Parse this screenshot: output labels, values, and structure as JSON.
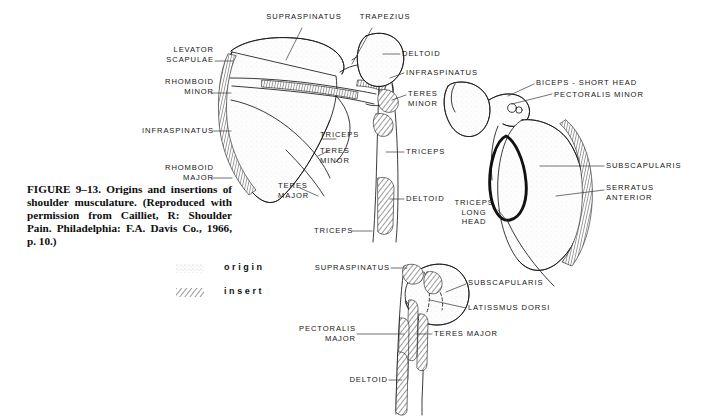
{
  "figure": {
    "caption": "FIGURE 9–13. Origins and insertions of shoulder musculature. (Reproduced with permission from Cailliet, R: Shoulder Pain. Philadelphia: F.A. Davis Co., 1966, p. 10.)",
    "background_color": "#ffffff",
    "ink_color": "#161616"
  },
  "legend": {
    "items": [
      {
        "key": "origin",
        "label": "origin",
        "pattern": "stipple"
      },
      {
        "key": "insert",
        "label": "insert",
        "pattern": "hatch"
      }
    ]
  },
  "panels": [
    {
      "id": "posterior-scapula-humerus",
      "name": "posterior-view",
      "labels": [
        {
          "id": "supraspinatus-top",
          "text": "SUPRASPINATUS"
        },
        {
          "id": "trapezius",
          "text": "TRAPEZIUS"
        },
        {
          "id": "levator-scapulae",
          "text": "LEVATOR\nSCAPULAE"
        },
        {
          "id": "rhomboid-minor",
          "text": "RHOMBOID\nMINOR"
        },
        {
          "id": "infraspinatus-left",
          "text": "INFRASPINATUS"
        },
        {
          "id": "rhomboid-major",
          "text": "RHOMBOID\nMAJOR"
        },
        {
          "id": "triceps-upper",
          "text": "TRICEPS"
        },
        {
          "id": "teres-minor-mid",
          "text": "TERES\nMINOR"
        },
        {
          "id": "teres-major",
          "text": "TERES\nMAJOR"
        },
        {
          "id": "triceps-lower",
          "text": "TRICEPS"
        },
        {
          "id": "deltoid-upper",
          "text": "DELTOID"
        },
        {
          "id": "infraspinatus-right",
          "text": "INFRASPINATUS"
        },
        {
          "id": "teres-minor-right",
          "text": "TERES\nMINOR"
        },
        {
          "id": "triceps-humerus",
          "text": "TRICEPS"
        },
        {
          "id": "deltoid-lower",
          "text": "DELTOID"
        }
      ]
    },
    {
      "id": "anterior-scapula",
      "name": "anterior-scapula-view",
      "labels": [
        {
          "id": "biceps-short-head",
          "text": "BICEPS - SHORT HEAD"
        },
        {
          "id": "pectoralis-minor",
          "text": "PECTORALIS MINOR"
        },
        {
          "id": "subscapularis-right",
          "text": "SUBSCAPULARIS"
        },
        {
          "id": "serratus-anterior",
          "text": "SERRATUS\nANTERIOR"
        },
        {
          "id": "triceps-long-head",
          "text": "TRICEPS\nLONG\nHEAD"
        }
      ]
    },
    {
      "id": "anterior-humerus",
      "name": "anterior-humerus-view",
      "labels": [
        {
          "id": "supraspinatus-bottom",
          "text": "SUPRASPINATUS"
        },
        {
          "id": "subscapularis-bottom",
          "text": "SUBSCAPULARIS"
        },
        {
          "id": "latissmus-dorsi",
          "text": "LATISSMUS DORSI"
        },
        {
          "id": "pectoralis-major",
          "text": "PECTORALIS\nMAJOR"
        },
        {
          "id": "teres-major-bottom",
          "text": "TERES MAJOR"
        },
        {
          "id": "deltoid-bottom",
          "text": "DELTOID"
        }
      ]
    }
  ]
}
